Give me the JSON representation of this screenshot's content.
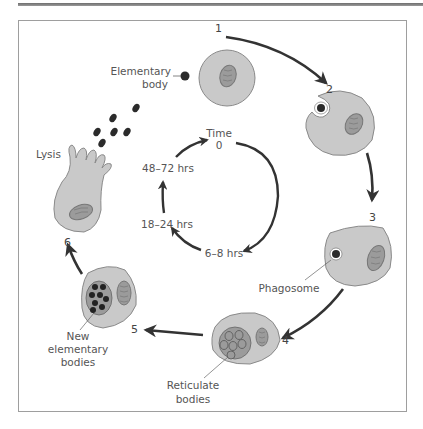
{
  "figure": {
    "stages": [
      {
        "number": "1",
        "label": "Elementary body"
      },
      {
        "number": "2",
        "label": ""
      },
      {
        "number": "3",
        "label": "Phagosome"
      },
      {
        "number": "4",
        "label": "Reticulate bodies"
      },
      {
        "number": "5",
        "label": "New elementary bodies"
      },
      {
        "number": "6",
        "label": "Lysis"
      }
    ],
    "labels": {
      "elementary_body_1": "Elementary",
      "elementary_body_2": "body",
      "phagosome": "Phagosome",
      "reticulate_1": "Reticulate",
      "reticulate_2": "bodies",
      "new_eb_1": "New",
      "new_eb_2": "elementary",
      "new_eb_3": "bodies",
      "lysis": "Lysis"
    },
    "timeline": {
      "title": "Time",
      "points": [
        "0",
        "6–8 hrs",
        "18–24 hrs",
        "48–72 hrs"
      ]
    },
    "colors": {
      "cell_fill": "#c9c9c9",
      "cell_stroke": "#8a8a8a",
      "nucleus_fill": "#9b9b9b",
      "arrow": "#333333",
      "body_dark": "#2b2b2b",
      "frame": "#9e9e9e"
    }
  }
}
